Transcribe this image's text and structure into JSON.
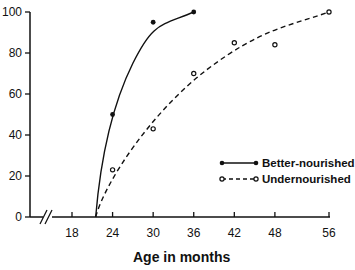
{
  "chart_data": {
    "type": "line",
    "title": "",
    "xlabel": "Age in months",
    "ylabel": "",
    "xlim": [
      15,
      57
    ],
    "ylim": [
      0,
      100
    ],
    "x_ticks": [
      18,
      24,
      30,
      36,
      42,
      48,
      56
    ],
    "y_ticks": [
      0,
      20,
      40,
      60,
      80,
      100
    ],
    "axis_break": "x-axis break (//) near origin",
    "grid": false,
    "legend_position": "lower right",
    "series": [
      {
        "name": "Better-nourished",
        "style": "solid line, filled circle markers",
        "points": [
          {
            "x": 24,
            "y": 50
          },
          {
            "x": 30,
            "y": 95
          },
          {
            "x": 36,
            "y": 100
          }
        ],
        "curve_start": {
          "x": 21.5,
          "y": 0
        }
      },
      {
        "name": "Undernourished",
        "style": "dashed line, open circle markers",
        "points": [
          {
            "x": 24,
            "y": 23
          },
          {
            "x": 30,
            "y": 43
          },
          {
            "x": 36,
            "y": 70
          },
          {
            "x": 42,
            "y": 85
          },
          {
            "x": 48,
            "y": 84
          },
          {
            "x": 56,
            "y": 100
          }
        ],
        "curve_start": {
          "x": 21.5,
          "y": 0
        }
      }
    ]
  },
  "labels": {
    "x_axis_title": "Age in months",
    "y_ticks": [
      "0",
      "20",
      "40",
      "60",
      "80",
      "100"
    ],
    "x_ticks": [
      "18",
      "24",
      "30",
      "36",
      "42",
      "48",
      "56"
    ],
    "legend": [
      "Better-nourished",
      "Undernourished"
    ]
  }
}
